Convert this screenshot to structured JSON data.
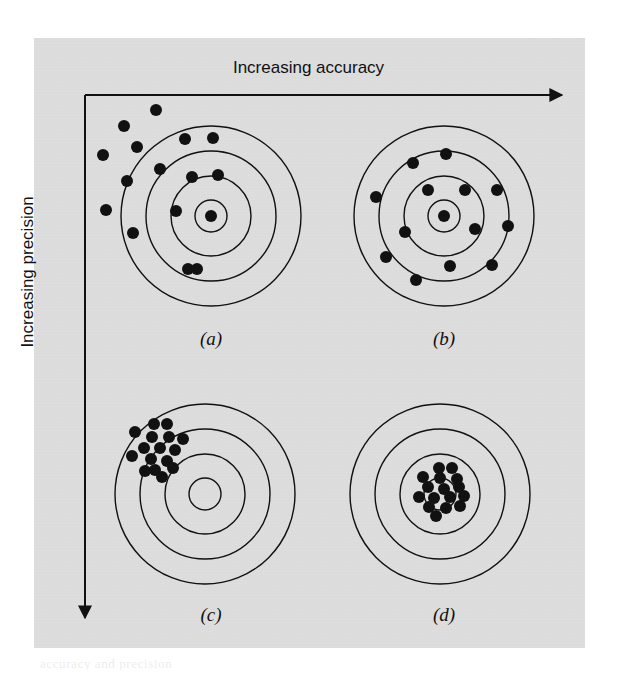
{
  "figure": {
    "kind": "accuracy-precision-target-diagram",
    "background_color": "#ffffff",
    "panel_color": "#dedede",
    "ink_color": "#111111",
    "axes": {
      "x_label": "Increasing accuracy",
      "y_label": "Increasing precision",
      "x_arrow_direction": "right",
      "y_arrow_direction": "down",
      "origin_px": [
        85,
        95
      ],
      "x_end_px": [
        568,
        95
      ],
      "y_end_px": [
        85,
        624
      ]
    },
    "ghost_text": "accuracy and precision"
  },
  "chart_data": {
    "type": "scatter",
    "title": "Increasing accuracy",
    "xlabel": "Increasing accuracy",
    "ylabel": "Increasing precision",
    "grid": false,
    "legend": "none",
    "subplot_layout": "2x2",
    "ring_radii_px": [
      16,
      40,
      65,
      90
    ],
    "dot_radius_px": 6,
    "panels": [
      {
        "label": "(a)",
        "description": "low accuracy, low precision",
        "center_px": [
          211,
          216
        ],
        "caption_px": [
          211,
          342
        ],
        "points": [
          [
            156,
            110
          ],
          [
            124,
            126
          ],
          [
            137,
            147
          ],
          [
            103,
            155
          ],
          [
            185,
            139
          ],
          [
            213,
            138
          ],
          [
            160,
            169
          ],
          [
            192,
            177
          ],
          [
            218,
            175
          ],
          [
            127,
            181
          ],
          [
            106,
            210
          ],
          [
            176,
            211
          ],
          [
            211,
            216
          ],
          [
            133,
            233
          ],
          [
            188,
            269
          ],
          [
            197,
            269
          ]
        ]
      },
      {
        "label": "(b)",
        "description": "high accuracy, low precision",
        "center_px": [
          444,
          216
        ],
        "caption_px": [
          444,
          342
        ],
        "points": [
          [
            446,
            154
          ],
          [
            413,
            163
          ],
          [
            428,
            190
          ],
          [
            465,
            190
          ],
          [
            497,
            190
          ],
          [
            376,
            197
          ],
          [
            444,
            216
          ],
          [
            405,
            232
          ],
          [
            475,
            229
          ],
          [
            508,
            226
          ],
          [
            386,
            257
          ],
          [
            450,
            266
          ],
          [
            416,
            280
          ],
          [
            492,
            265
          ]
        ]
      },
      {
        "label": "(c)",
        "description": "low accuracy, high precision",
        "center_px": [
          205,
          494
        ],
        "caption_px": [
          205,
          618
        ],
        "points": [
          [
            154,
            424
          ],
          [
            167,
            424
          ],
          [
            135,
            432
          ],
          [
            152,
            437
          ],
          [
            169,
            437
          ],
          [
            183,
            439
          ],
          [
            144,
            448
          ],
          [
            160,
            448
          ],
          [
            175,
            450
          ],
          [
            132,
            456
          ],
          [
            151,
            459
          ],
          [
            167,
            461
          ],
          [
            155,
            470
          ],
          [
            173,
            468
          ],
          [
            145,
            471
          ],
          [
            162,
            477
          ]
        ]
      },
      {
        "label": "(d)",
        "description": "high accuracy, high precision",
        "center_px": [
          440,
          494
        ],
        "caption_px": [
          440,
          618
        ],
        "points": [
          [
            439,
            468
          ],
          [
            452,
            468
          ],
          [
            423,
            477
          ],
          [
            440,
            478
          ],
          [
            457,
            479
          ],
          [
            428,
            487
          ],
          [
            444,
            489
          ],
          [
            459,
            487
          ],
          [
            419,
            497
          ],
          [
            434,
            498
          ],
          [
            450,
            497
          ],
          [
            464,
            496
          ],
          [
            429,
            507
          ],
          [
            446,
            508
          ],
          [
            460,
            506
          ],
          [
            436,
            516
          ]
        ]
      }
    ]
  }
}
